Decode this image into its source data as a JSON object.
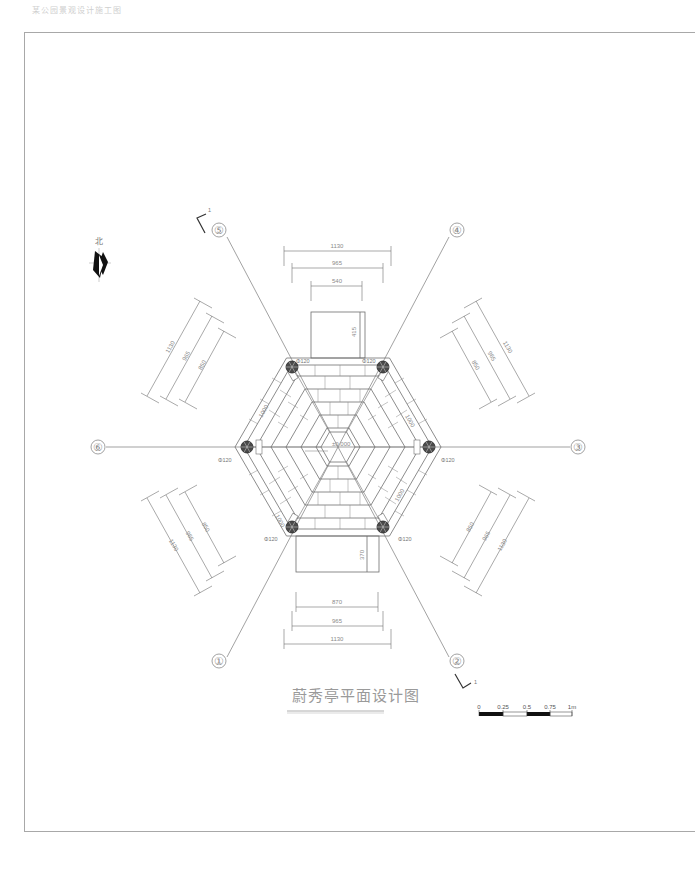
{
  "header": {
    "note": "某公园景观设计施工图"
  },
  "drawing": {
    "title": "蔚秀亭平面设计图",
    "north_label": "北",
    "section_mark": "1",
    "center_elevation": "±0.000",
    "column_label": "Φ120",
    "axes": [
      {
        "id": "1",
        "label": "①"
      },
      {
        "id": "2",
        "label": "②"
      },
      {
        "id": "3",
        "label": "③"
      },
      {
        "id": "4",
        "label": "④"
      },
      {
        "id": "5",
        "label": "⑤"
      },
      {
        "id": "6",
        "label": "⑥"
      }
    ],
    "dimensions": {
      "top": [
        "1130",
        "965",
        "540"
      ],
      "top_step_depth": "415",
      "bottom": [
        "870",
        "965",
        "1130"
      ],
      "bottom_step_depth": "370",
      "upper_left": [
        "1130",
        "965",
        "850"
      ],
      "upper_right": [
        "1130",
        "965",
        "850"
      ],
      "lower_left": [
        "850",
        "965",
        "1130"
      ],
      "lower_right": [
        "850",
        "965",
        "1130"
      ],
      "inner_edge": "1000"
    },
    "scale_bar": {
      "labels": [
        "0",
        "0.25",
        "0.5",
        "0.75",
        "1m"
      ]
    }
  },
  "colors": {
    "line": "#6e6e6e",
    "frame": "#a8a8a8",
    "column_fill": "#3a3a3a",
    "text": "#8a8a8a"
  }
}
